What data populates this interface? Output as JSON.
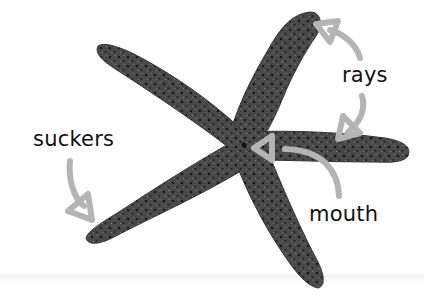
{
  "diagram": {
    "labels": [
      {
        "id": "rays",
        "text": "rays"
      },
      {
        "id": "suckers",
        "text": "suckers"
      },
      {
        "id": "mouth",
        "text": "mouth"
      }
    ],
    "colors": {
      "arrow": "#b4b4b4",
      "body_dark": "#2e2e2e",
      "body_mid": "#5a5a5a",
      "text": "#111111",
      "background": "#ffffff"
    }
  }
}
